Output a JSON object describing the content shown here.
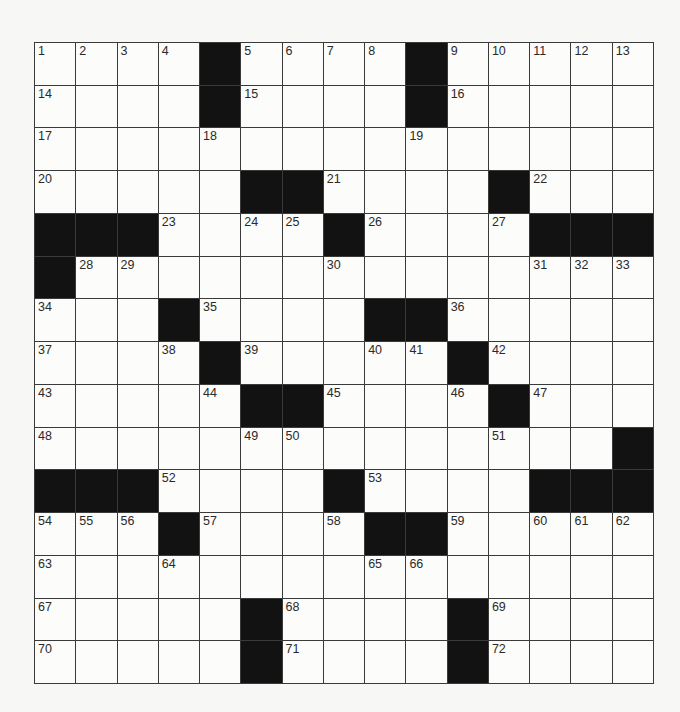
{
  "puzzle": {
    "rows": 15,
    "cols": 15,
    "colors": {
      "block": "#121212",
      "cell": "#fcfcfb",
      "line": "#3a3a3a",
      "background": "#f7f7f5"
    },
    "grid": [
      [
        "1",
        "2",
        "3",
        "4",
        "#",
        "5",
        "6",
        "7",
        "8",
        "#",
        "9",
        "10",
        "11",
        "12",
        "13"
      ],
      [
        "14",
        "",
        "",
        "",
        "#",
        "15",
        "",
        "",
        "",
        "#",
        "16",
        "",
        "",
        "",
        ""
      ],
      [
        "17",
        "",
        "",
        "",
        "18",
        "",
        "",
        "",
        "",
        "19",
        "",
        "",
        "",
        "",
        ""
      ],
      [
        "20",
        "",
        "",
        "",
        "",
        "#",
        "#",
        "21",
        "",
        "",
        "",
        "#",
        "22",
        "",
        ""
      ],
      [
        "#",
        "#",
        "#",
        "23",
        "",
        "24",
        "25",
        "#",
        "26",
        "",
        "",
        "27",
        "#",
        "#",
        "#"
      ],
      [
        "#",
        "28",
        "29",
        "",
        "",
        "",
        "",
        "30",
        "",
        "",
        "",
        "",
        "31",
        "32",
        "33"
      ],
      [
        "34",
        "",
        "",
        "#",
        "35",
        "",
        "",
        "",
        "#",
        "#",
        "36",
        "",
        "",
        "",
        ""
      ],
      [
        "37",
        "",
        "",
        "38",
        "#",
        "39",
        "",
        "",
        "40",
        "41",
        "#",
        "42",
        "",
        "",
        ""
      ],
      [
        "43",
        "",
        "",
        "",
        "44",
        "#",
        "#",
        "45",
        "",
        "",
        "46",
        "#",
        "47",
        "",
        ""
      ],
      [
        "48",
        "",
        "",
        "",
        "",
        "49",
        "50",
        "",
        "",
        "",
        "",
        "51",
        "",
        "",
        "#"
      ],
      [
        "#",
        "#",
        "#",
        "52",
        "",
        "",
        "",
        "#",
        "53",
        "",
        "",
        "",
        "#",
        "#",
        "#"
      ],
      [
        "54",
        "55",
        "56",
        "#",
        "57",
        "",
        "",
        "58",
        "#",
        "#",
        "59",
        "",
        "60",
        "61",
        "62"
      ],
      [
        "63",
        "",
        "",
        "64",
        "",
        "",
        "",
        "",
        "65",
        "66",
        "",
        "",
        "",
        "",
        ""
      ],
      [
        "67",
        "",
        "",
        "",
        "",
        "#",
        "68",
        "",
        "",
        "",
        "#",
        "69",
        "",
        "",
        ""
      ],
      [
        "70",
        "",
        "",
        "",
        "",
        "#",
        "71",
        "",
        "",
        "",
        "#",
        "72",
        "",
        "",
        ""
      ]
    ],
    "entries": []
  }
}
